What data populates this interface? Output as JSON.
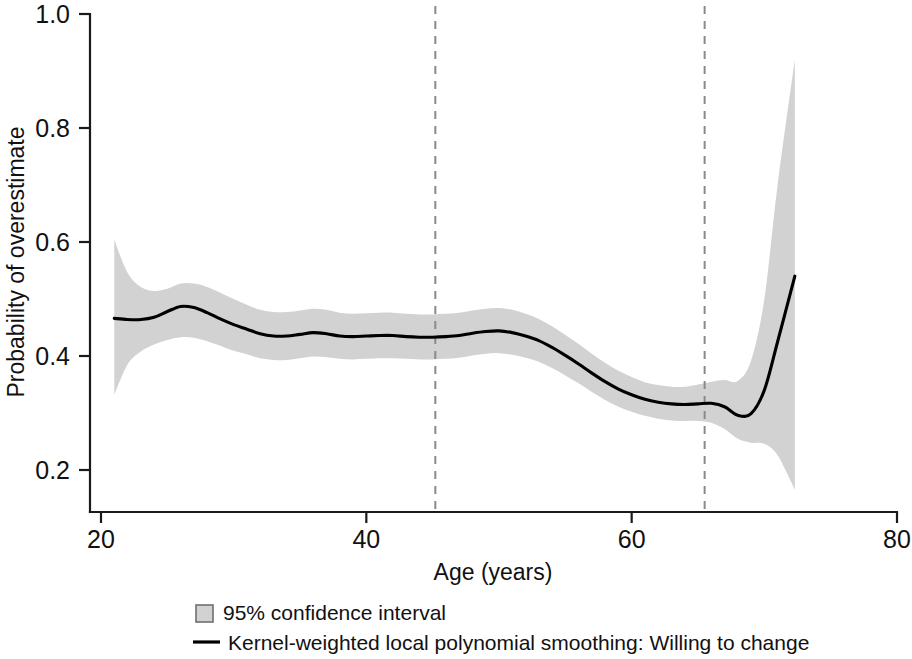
{
  "chart_data": {
    "type": "line",
    "title": "",
    "subtitle": "",
    "xlabel": "Age (years)",
    "ylabel": "Probability of overestimate",
    "xlim": [
      20,
      80
    ],
    "ylim": [
      0.1,
      1.0
    ],
    "xticks": [
      20,
      40,
      60,
      80
    ],
    "xtick_labels": [
      "20",
      "40",
      "60",
      "80"
    ],
    "yticks": [
      0.2,
      0.4,
      0.6,
      0.8,
      1.0
    ],
    "ytick_labels": [
      "0.2",
      "0.4",
      "0.6",
      "0.8",
      "1.0"
    ],
    "grid": false,
    "legend_position": "bottom",
    "legend": [
      {
        "label": "95% confidence interval",
        "marker": "filled-square",
        "color": "#d2d2d2"
      },
      {
        "label": "Kernel-weighted local polynomial smoothing: Willing to change",
        "marker": "line",
        "color": "#000000"
      }
    ],
    "annotations": [
      {
        "type": "vertical-dashed-line",
        "x": 45.2
      },
      {
        "type": "vertical-dashed-line",
        "x": 65.5
      }
    ],
    "series": [
      {
        "name": "Kernel-weighted local polynomial smoothing: Willing to change",
        "color": "#000000",
        "x": [
          21.0,
          22.0,
          23.0,
          24.0,
          25.0,
          26.0,
          27.0,
          28.0,
          29.0,
          30.0,
          31.0,
          32.0,
          33.0,
          34.0,
          35.0,
          36.0,
          37.0,
          38.0,
          39.0,
          40.0,
          41.0,
          42.0,
          43.0,
          44.0,
          45.0,
          46.0,
          47.0,
          48.0,
          49.0,
          50.0,
          51.0,
          52.0,
          53.0,
          54.0,
          55.0,
          56.0,
          57.0,
          58.0,
          59.0,
          60.0,
          61.0,
          62.0,
          63.0,
          64.0,
          65.0,
          66.0,
          67.0,
          68.0,
          69.0,
          70.0,
          71.0,
          72.3
        ],
        "y": [
          0.466,
          0.464,
          0.464,
          0.468,
          0.478,
          0.487,
          0.485,
          0.476,
          0.465,
          0.455,
          0.447,
          0.439,
          0.435,
          0.435,
          0.438,
          0.441,
          0.439,
          0.435,
          0.434,
          0.435,
          0.436,
          0.436,
          0.434,
          0.433,
          0.433,
          0.434,
          0.436,
          0.44,
          0.443,
          0.444,
          0.441,
          0.435,
          0.427,
          0.415,
          0.401,
          0.386,
          0.37,
          0.355,
          0.342,
          0.332,
          0.324,
          0.319,
          0.316,
          0.315,
          0.316,
          0.317,
          0.311,
          0.296,
          0.299,
          0.34,
          0.425,
          0.54
        ]
      }
    ],
    "confidence_band": {
      "name": "95% confidence interval",
      "level": 0.95,
      "color": "#d2d2d2",
      "x": [
        21.0,
        22.0,
        23.0,
        24.0,
        25.0,
        26.0,
        27.0,
        28.0,
        29.0,
        30.0,
        31.0,
        32.0,
        33.0,
        34.0,
        35.0,
        36.0,
        37.0,
        38.0,
        39.0,
        40.0,
        41.0,
        42.0,
        43.0,
        44.0,
        45.0,
        46.0,
        47.0,
        48.0,
        49.0,
        50.0,
        51.0,
        52.0,
        53.0,
        54.0,
        55.0,
        56.0,
        57.0,
        58.0,
        59.0,
        60.0,
        61.0,
        62.0,
        63.0,
        64.0,
        65.0,
        66.0,
        67.0,
        68.0,
        69.0,
        70.0,
        71.0,
        72.3
      ],
      "lower": [
        0.332,
        0.385,
        0.408,
        0.42,
        0.428,
        0.433,
        0.432,
        0.426,
        0.418,
        0.409,
        0.403,
        0.396,
        0.393,
        0.393,
        0.396,
        0.399,
        0.398,
        0.395,
        0.394,
        0.395,
        0.396,
        0.396,
        0.395,
        0.394,
        0.394,
        0.395,
        0.397,
        0.401,
        0.404,
        0.405,
        0.402,
        0.397,
        0.39,
        0.379,
        0.366,
        0.352,
        0.337,
        0.323,
        0.311,
        0.302,
        0.295,
        0.29,
        0.287,
        0.286,
        0.286,
        0.283,
        0.272,
        0.255,
        0.248,
        0.246,
        0.226,
        0.166
      ],
      "upper": [
        0.604,
        0.546,
        0.521,
        0.514,
        0.518,
        0.527,
        0.527,
        0.521,
        0.511,
        0.5,
        0.49,
        0.481,
        0.477,
        0.477,
        0.48,
        0.483,
        0.481,
        0.476,
        0.474,
        0.475,
        0.476,
        0.476,
        0.474,
        0.473,
        0.473,
        0.474,
        0.476,
        0.48,
        0.483,
        0.484,
        0.481,
        0.474,
        0.465,
        0.452,
        0.437,
        0.421,
        0.404,
        0.388,
        0.374,
        0.363,
        0.354,
        0.349,
        0.346,
        0.346,
        0.35,
        0.355,
        0.358,
        0.356,
        0.392,
        0.5,
        0.7,
        0.92
      ]
    }
  },
  "axes": {
    "x_title": "Age (years)",
    "y_title": "Probability of overestimate"
  },
  "legend": {
    "ci_label": "95% confidence interval",
    "line_label": "Kernel-weighted local polynomial smoothing: Willing to change"
  }
}
